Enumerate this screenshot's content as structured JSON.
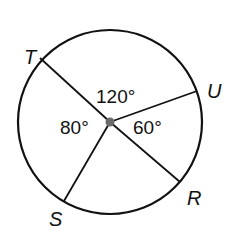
{
  "diagram": {
    "type": "circle-with-central-angles",
    "colors": {
      "stroke": "#111111",
      "center_dot": "#6b6b6b",
      "background": "#ffffff"
    },
    "circle": {
      "cx": 110,
      "cy": 122,
      "r": 92
    },
    "center": {
      "x": 110,
      "y": 122,
      "dot_r": 4.5
    },
    "points": [
      {
        "name": "T",
        "x": 40,
        "y": 58,
        "label_x": 24,
        "label_y": 64
      },
      {
        "name": "U",
        "x": 197,
        "y": 91,
        "label_x": 207,
        "label_y": 98
      },
      {
        "name": "R",
        "x": 180,
        "y": 182,
        "label_x": 187,
        "label_y": 205
      },
      {
        "name": "S",
        "x": 64,
        "y": 201,
        "label_x": 49,
        "label_y": 226
      }
    ],
    "angles": [
      {
        "between": [
          "T",
          "U"
        ],
        "label": "120°",
        "x": 96,
        "y": 103
      },
      {
        "between": [
          "T",
          "S"
        ],
        "label": "80°",
        "x": 60,
        "y": 134
      },
      {
        "between": [
          "U",
          "R"
        ],
        "label": "60°",
        "x": 133,
        "y": 134
      }
    ]
  }
}
